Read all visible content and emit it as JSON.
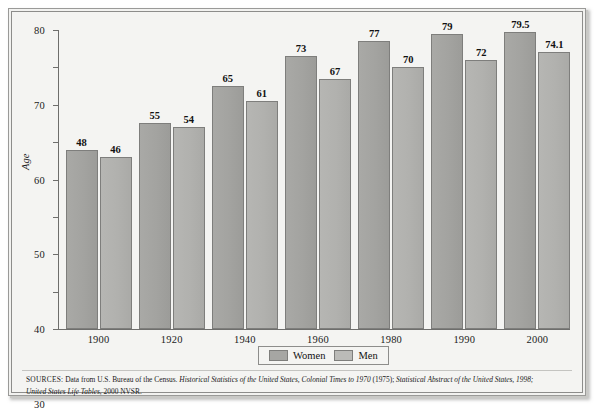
{
  "chart_data": {
    "type": "bar",
    "title": "",
    "subtitle": "",
    "xlabel": "",
    "ylabel": "Age",
    "ylim": [
      0,
      80
    ],
    "yticks": [
      0,
      10,
      20,
      30,
      40,
      50,
      60,
      70,
      80
    ],
    "ytick_labels": [
      "0",
      "10",
      "20",
      "30",
      "40",
      "50",
      "60",
      "70",
      "80"
    ],
    "grid": false,
    "legend_position": "bottom-center",
    "categories": [
      "1900",
      "1920",
      "1940",
      "1960",
      "1980",
      "1990",
      "2000"
    ],
    "series": [
      {
        "name": "Women",
        "color": "#a3a3a0",
        "values": [
          48,
          55,
          65,
          73,
          77,
          79,
          79.5
        ],
        "labels": [
          "48",
          "55",
          "65",
          "73",
          "77",
          "79",
          "79.5"
        ]
      },
      {
        "name": "Men",
        "color": "#b1b1ae",
        "values": [
          46,
          54,
          61,
          67,
          70,
          72,
          74.1
        ],
        "labels": [
          "46",
          "54",
          "61",
          "67",
          "70",
          "72",
          "74.1"
        ]
      }
    ]
  },
  "legend": {
    "items": [
      {
        "label": "Women",
        "swatch_class": "women"
      },
      {
        "label": "Men",
        "swatch_class": "men"
      }
    ]
  },
  "sources": {
    "label": "SOURCES:",
    "line1_plain_a": " Data from U.S. Bureau of the Census. ",
    "line1_italic_a": "Historical Statistics of the United States, Colonial Times to 1970",
    "line1_plain_b": " (1975); ",
    "line1_italic_b": "Statistical Abstract of the United States, 1998;",
    "line2_italic": "United States Life Tables",
    "line2_plain": ", 2000 NVSR."
  },
  "colors": {
    "women_bar": "#a3a3a0",
    "men_bar": "#b1b1ae",
    "frame_border": "#8d8d8b",
    "plot_background": "#f4f4f2",
    "axis": "#6e6e6c",
    "text": "#1b1b1b"
  }
}
